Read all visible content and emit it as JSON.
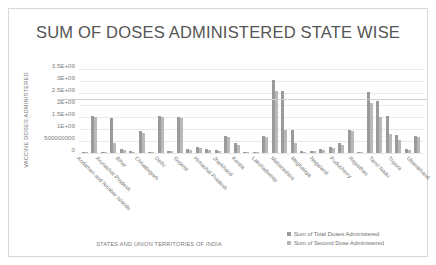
{
  "chart_data": {
    "type": "bar",
    "title": "SUM OF DOSES ADMINISTERED STATE WISE",
    "xlabel": "STATES AND UNION TERRITORIES OF INDIA",
    "ylabel": "VACCINE DOSES ADMINISTERED",
    "ylim": [
      0,
      3750000000
    ],
    "grid": true,
    "legend_position": "bottom-right",
    "ytick_labels": [
      "3.5E+09",
      "3E+09",
      "2.5E+09",
      "2E+09",
      "1.5E+09",
      "1E+09",
      "500000000",
      "0"
    ],
    "ytick_values": [
      3500000000,
      3000000000,
      2500000000,
      2000000000,
      1500000000,
      1000000000,
      500000000,
      0
    ],
    "categories": [
      "Andaman and Nicobar Islands",
      "Andhra Pradesh",
      "Arunachal Pradesh",
      "Assam",
      "Bihar",
      "Chandigarh",
      "Chhattisgarh",
      "Dadra and Nagar Haveli",
      "Delhi",
      "Goa",
      "Gujarat",
      "Haryana",
      "Himachal Pradesh",
      "Jammu and Kashmir",
      "Jharkhand",
      "Karnataka",
      "Kerala",
      "Ladakh",
      "Lakshadweep",
      "Madhya Pradesh",
      "Maharashtra",
      "Manipur",
      "Meghalaya",
      "Mizoram",
      "Nagaland",
      "Odisha",
      "Puducherry",
      "Punjab",
      "Rajasthan",
      "Sikkim",
      "Tamil Nadu",
      "Telangana",
      "Tripura",
      "Uttar Pradesh",
      "Uttarakhand",
      "West Bengal"
    ],
    "visible_tick_labels": [
      "Andaman and Nicobar Islands",
      "Arunachal Pradesh",
      "Bihar",
      "Chhattisgarh",
      "Delhi",
      "Gujarat",
      "Himachal Pradesh",
      "Jharkhand",
      "Kerala",
      "Lakshadweep",
      "Maharashtra",
      "Meghalaya",
      "Nagaland",
      "Puducherry",
      "Rajasthan",
      "Tamil Nadu",
      "Tripura",
      "Uttarakhand"
    ],
    "series": [
      {
        "name": "Sum of Total Doses Administered",
        "color": "#9a9a9a",
        "values": [
          60000000,
          1550000000,
          60000000,
          1450000000,
          150000000,
          75000000,
          900000000,
          60000000,
          1550000000,
          90000000,
          1500000000,
          160000000,
          260000000,
          180000000,
          130000000,
          700000000,
          400000000,
          60000000,
          60000000,
          700000000,
          3050000000,
          2600000000,
          950000000,
          75000000,
          90000000,
          160000000,
          260000000,
          400000000,
          950000000,
          60000000,
          2550000000,
          2150000000,
          1550000000,
          750000000,
          160000000,
          700000000
        ]
      },
      {
        "name": "Sum of Second Dose Administered",
        "color": "#b9b9b9",
        "values": [
          50000000,
          1500000000,
          50000000,
          400000000,
          110000000,
          60000000,
          850000000,
          50000000,
          1500000000,
          70000000,
          1450000000,
          120000000,
          200000000,
          140000000,
          100000000,
          650000000,
          330000000,
          50000000,
          50000000,
          650000000,
          2600000000,
          950000000,
          400000000,
          60000000,
          70000000,
          120000000,
          200000000,
          330000000,
          900000000,
          50000000,
          2100000000,
          1500000000,
          800000000,
          550000000,
          120000000,
          650000000
        ]
      }
    ]
  },
  "legend": {
    "items": [
      {
        "label": "Sum of Total Doses Administered",
        "color": "#9a9a9a"
      },
      {
        "label": "Sum of Second Dose Administered",
        "color": "#b9b9b9"
      }
    ]
  }
}
